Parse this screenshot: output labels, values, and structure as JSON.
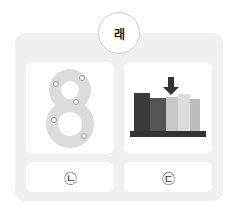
{
  "title": "래",
  "cards": [
    {
      "image": "number-eight-with-flowers"
    },
    {
      "image": "books-with-arrow"
    }
  ],
  "options": [
    {
      "label": "㉡"
    },
    {
      "label": "㉢"
    }
  ],
  "colors": {
    "panel": "#f0f0f0",
    "card": "#ffffff",
    "dark_book": "#3b3b3b"
  }
}
